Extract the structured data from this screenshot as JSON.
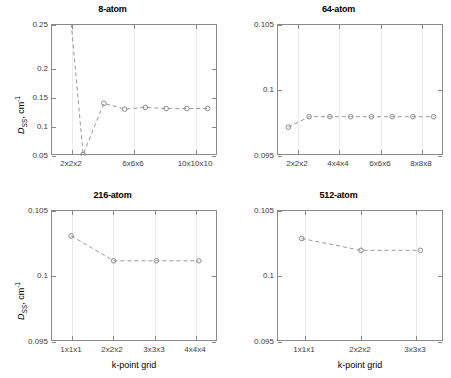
{
  "figure": {
    "background": "#ffffff",
    "line_color": "#9a9a9a",
    "marker_color": "#8c8c8c",
    "axis_color": "#8a8a8a",
    "grid_color": "#eceaea"
  },
  "axis_labels": {
    "y_symbol": "D",
    "y_subscript": "SS",
    "y_unit": ", cm",
    "y_unit_exp": "-1",
    "x_label": "k-point grid"
  },
  "chart_data": [
    {
      "type": "line",
      "title": "8-atom",
      "panel": "top-left",
      "xlabel": "",
      "ylabel": "D_SS, cm^-1",
      "categories": [
        "1x1x1",
        "2x2x2",
        "3x3x3",
        "4x4x4",
        "6x6x6",
        "8x8x8",
        "10x10x10",
        "12x12x12"
      ],
      "xtick_labels": [
        "2x2x2",
        "6x6x6",
        "10x10x10"
      ],
      "xtick_positions": [
        2,
        5,
        7
      ],
      "x": [
        1,
        2,
        3,
        4,
        5,
        6,
        7,
        8
      ],
      "values": [
        0.42,
        0.0275,
        0.1155,
        0.1055,
        0.1085,
        0.1065,
        0.1065,
        0.1065
      ],
      "ylim": [
        0.025,
        0.25
      ],
      "yticks": [
        0.05,
        0.1,
        0.15,
        0.2,
        0.25
      ],
      "ytick_labels": [
        "0.05",
        "0.1",
        "0.15",
        "0.2",
        "0.25"
      ],
      "xlim": [
        0.5,
        8.5
      ],
      "grid": true,
      "legend": "none",
      "note": "first point clipped above axis top"
    },
    {
      "type": "line",
      "title": "64-atom",
      "panel": "top-right",
      "xlabel": "",
      "ylabel": "",
      "categories": [
        "1x1x1",
        "2x2x2",
        "3x3x3",
        "4x4x4",
        "5x5x5",
        "6x6x6",
        "7x7x7",
        "8x8x8"
      ],
      "xtick_labels": [
        "2x2x2",
        "4x4x4",
        "6x6x6",
        "8x8x8"
      ],
      "xtick_positions": [
        2,
        4,
        6,
        8
      ],
      "x": [
        1,
        2,
        3,
        4,
        5,
        6,
        7,
        8
      ],
      "values": [
        0.0972,
        0.098,
        0.098,
        0.098,
        0.098,
        0.098,
        0.098,
        0.098
      ],
      "ylim": [
        0.095,
        0.105
      ],
      "yticks": [
        0.095,
        0.1,
        0.105
      ],
      "ytick_labels": [
        "0.095",
        "0.1",
        "0.105"
      ],
      "xlim": [
        0.5,
        8.5
      ],
      "grid": true,
      "legend": "none"
    },
    {
      "type": "line",
      "title": "216-atom",
      "panel": "bottom-left",
      "xlabel": "k-point grid",
      "ylabel": "D_SS, cm^-1",
      "categories": [
        "1x1x1",
        "2x2x2",
        "3x3x3",
        "4x4x4"
      ],
      "xtick_labels": [
        "1x1x1",
        "2x2x2",
        "3x3x3",
        "4x4x4"
      ],
      "xtick_positions": [
        1,
        2,
        3,
        4
      ],
      "x": [
        1,
        2,
        3,
        4
      ],
      "values": [
        0.1031,
        0.1012,
        0.1012,
        0.1012
      ],
      "ylim": [
        0.095,
        0.105
      ],
      "yticks": [
        0.095,
        0.1,
        0.105
      ],
      "ytick_labels": [
        "0.095",
        "0.1",
        "0.105"
      ],
      "xlim": [
        0.55,
        4.45
      ],
      "grid": true,
      "legend": "none"
    },
    {
      "type": "line",
      "title": "512-atom",
      "panel": "bottom-right",
      "xlabel": "k-point grid",
      "ylabel": "",
      "categories": [
        "1x1x1",
        "2x2x2",
        "3x3x3"
      ],
      "xtick_labels": [
        "1x1x1",
        "2x2x2",
        "3x3x3"
      ],
      "xtick_positions": [
        1,
        2,
        3
      ],
      "x": [
        1,
        2,
        3
      ],
      "values": [
        0.1029,
        0.102,
        0.102
      ],
      "ylim": [
        0.095,
        0.105
      ],
      "yticks": [
        0.095,
        0.1,
        0.105
      ],
      "ytick_labels": [
        "0.095",
        "0.1",
        "0.105"
      ],
      "xlim": [
        0.6,
        3.4
      ],
      "grid": true,
      "legend": "none"
    }
  ]
}
